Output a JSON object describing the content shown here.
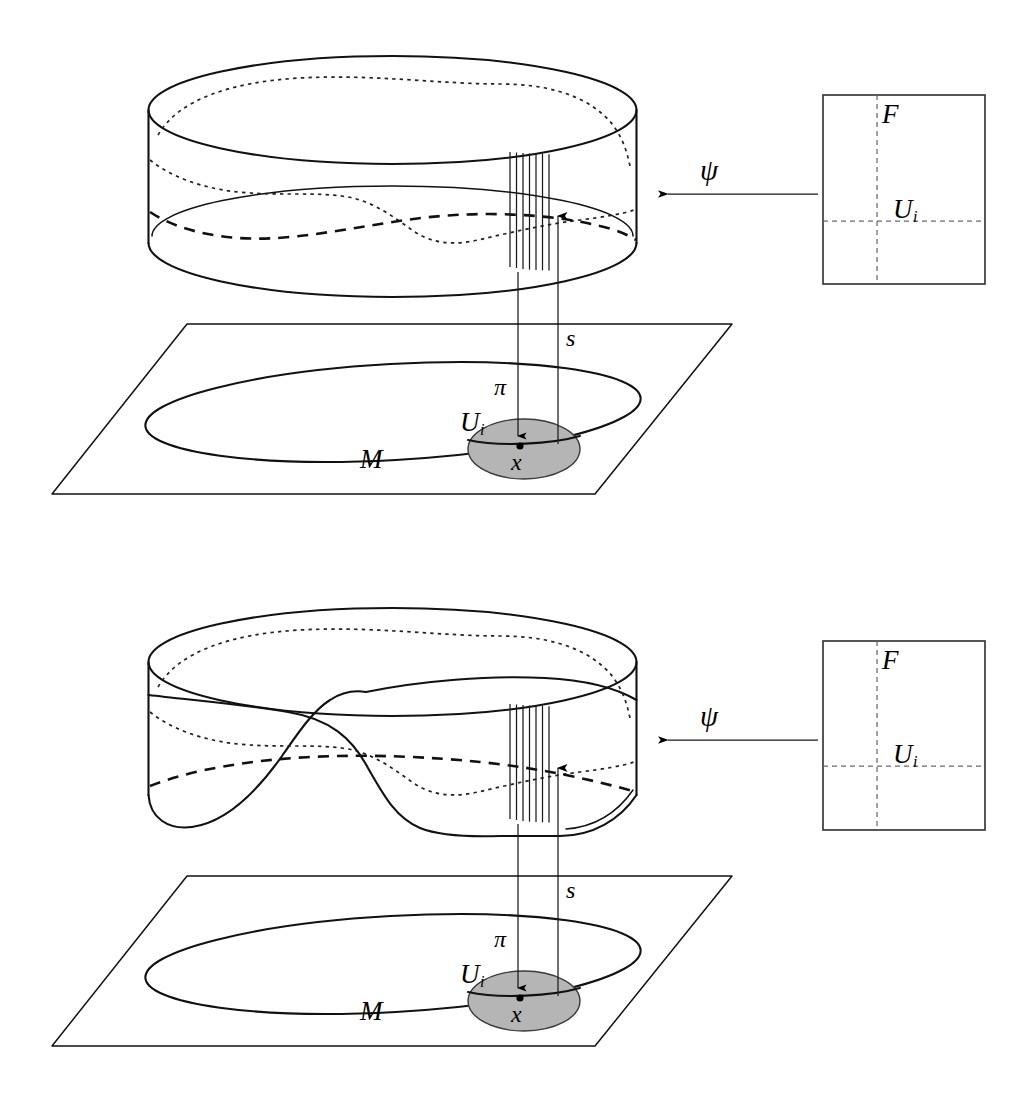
{
  "figure": {
    "domain": "Diagram",
    "caption_absent": true,
    "background_color": "#ffffff",
    "ink_color": "#111111",
    "patch_fill_color": "#b5b5b5",
    "panels": [
      {
        "id": "top-panel",
        "name": "trivial-bundle-panel",
        "description": "Untwisted (trivial) bundle over M: straight cylinder above the base plane",
        "bundle_twisted": false
      },
      {
        "id": "bottom-panel",
        "name": "twisted-bundle-panel",
        "description": "Twisted (nontrivial) bundle over M: cylinder whose lower boundary folds and crosses itself",
        "bundle_twisted": true
      }
    ]
  },
  "labels": {
    "total_space_section": "s",
    "projection": "π",
    "base_manifold": "M",
    "open_set": "U",
    "open_set_subscript": "i",
    "base_point": "x",
    "fiber": "F",
    "trivialization_map": "ψ"
  },
  "panel_top": {
    "section_label": "s",
    "projection_label": "π",
    "manifold_label": "M",
    "patch_label_base": "U",
    "patch_label_sub": "i",
    "point_label": "x",
    "chart_fiber_label": "F",
    "chart_patch_label_base": "U",
    "chart_patch_label_sub": "i",
    "map_label": "ψ"
  },
  "panel_bottom": {
    "section_label": "s",
    "projection_label": "π",
    "manifold_label": "M",
    "patch_label_base": "U",
    "patch_label_sub": "i",
    "point_label": "x",
    "chart_fiber_label": "F",
    "chart_patch_label_base": "U",
    "chart_patch_label_sub": "i",
    "map_label": "ψ"
  },
  "geometry": {
    "fiber_band_line_count": 7,
    "chart_rect": {
      "width": 162,
      "height": 189
    },
    "arrow_direction": "leftward"
  }
}
